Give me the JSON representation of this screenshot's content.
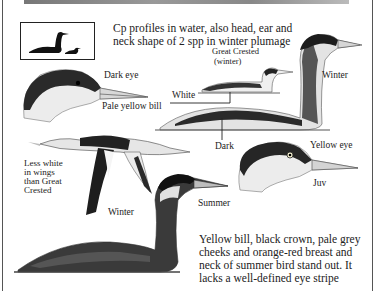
{
  "intro": {
    "line1": "Cp profiles in water, also head, ear and",
    "line2": "neck shape of 2 spp in winter plumage"
  },
  "labels": {
    "dark_eye": "Dark eye",
    "pale_yellow_bill": "Pale yellow bill",
    "great_crested_1": "Great Crested",
    "great_crested_2": "(winter)",
    "white": "White",
    "winter_right": "Winter",
    "dark": "Dark",
    "yellow_eye": "Yellow eye",
    "juv": "Juv",
    "less_white_1": "Less white",
    "less_white_2": "in wings",
    "less_white_3": "than Great",
    "less_white_4": "Crested",
    "winter_flight": "Winter",
    "summer": "Summer"
  },
  "description": {
    "line1": "Yellow bill, black crown, pale grey",
    "line2": "cheeks and orange-red breast and",
    "line3": "neck of summer bird stand out. It",
    "line4": "lacks a well-defined eye stripe"
  },
  "figures": [
    {
      "name": "profile-silhouettes",
      "desc": "silhouettes of Red-necked and Great Crested Grebe"
    },
    {
      "name": "head-dark-eye",
      "desc": "winter head with dark eye and pale yellow bill"
    },
    {
      "name": "great-crested-winter",
      "desc": "small Great Crested Grebe swimming"
    },
    {
      "name": "winter-swimming",
      "desc": "large winter grebe swimming"
    },
    {
      "name": "flight-winter",
      "desc": "grebe in flight"
    },
    {
      "name": "head-juv",
      "desc": "juvenile head with yellow eye"
    },
    {
      "name": "summer-swimming",
      "desc": "summer grebe swimming"
    }
  ],
  "colors": {
    "ink": "#1a1a1a",
    "dark_plumage": "#222222",
    "grey_plumage": "#8a8a8a",
    "pale": "#e8e8e8"
  }
}
